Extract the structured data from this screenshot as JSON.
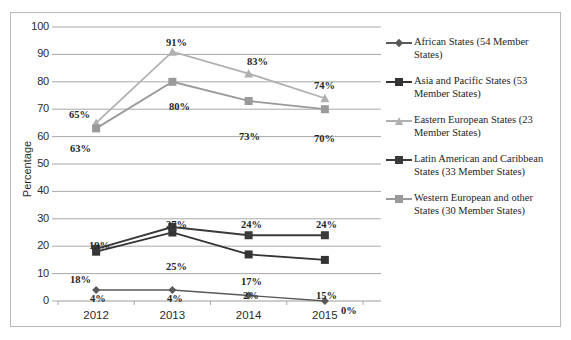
{
  "chart_data": {
    "type": "line",
    "title": "",
    "xlabel": "",
    "ylabel": "Percentage",
    "categories": [
      "2012",
      "2013",
      "2014",
      "2015"
    ],
    "ylim": [
      0,
      100
    ],
    "ytick_step": 10,
    "yticks": [
      "100",
      "90",
      "80",
      "70",
      "60",
      "50",
      "40",
      "30",
      "20",
      "10",
      "0"
    ],
    "grid": true,
    "legend_position": "right",
    "value_suffix": "%",
    "series": [
      {
        "name": "African States (54 Member States)",
        "short_name": "African States",
        "values": [
          4,
          4,
          2,
          0
        ],
        "labels": [
          "4%",
          "4%",
          "2%",
          "0%"
        ],
        "color": "#595959",
        "marker": "diamond"
      },
      {
        "name": "Asia and Pacific States (53 Member States)",
        "short_name": "Asia and Pacific States",
        "values": [
          18,
          25,
          17,
          15
        ],
        "labels": [
          "18%",
          "25%",
          "17%",
          "15%"
        ],
        "color": "#333333",
        "marker": "square"
      },
      {
        "name": "Eastern European States (23 Member States)",
        "short_name": "Eastern European States",
        "values": [
          65,
          91,
          83,
          74
        ],
        "labels": [
          "65%",
          "91%",
          "83%",
          "74%"
        ],
        "color": "#b0b0b0",
        "marker": "triangle"
      },
      {
        "name": "Latin American and Caribbean States (33 Member States)",
        "short_name": "Latin American and Caribbean States",
        "values": [
          19,
          27,
          24,
          24
        ],
        "labels": [
          "19%",
          "27%",
          "24%",
          "24%"
        ],
        "color": "#3a3a3a",
        "marker": "square"
      },
      {
        "name": "Western European and other States (30 Member States)",
        "short_name": "Western European and other States",
        "values": [
          63,
          80,
          73,
          70
        ],
        "labels": [
          "63%",
          "80%",
          "73%",
          "70%"
        ],
        "color": "#9a9a9a",
        "marker": "square"
      }
    ]
  },
  "axis": {
    "y_title": "Percentage",
    "y_ticks": [
      "100",
      "90",
      "80",
      "70",
      "60",
      "50",
      "40",
      "30",
      "20",
      "10",
      "0"
    ],
    "x_ticks": [
      "2012",
      "2013",
      "2014",
      "2015"
    ]
  },
  "legend": {
    "items": [
      {
        "label": "African States (54 Member States)",
        "color": "#595959",
        "marker": "diamond-marker"
      },
      {
        "label": "Asia and Pacific States (53 Member States)",
        "color": "#333333",
        "marker": "square-marker"
      },
      {
        "label": "Eastern European States (23 Member States)",
        "color": "#b0b0b0",
        "marker": "triangle-marker"
      },
      {
        "label": "Latin American and Caribbean States (33 Member States)",
        "color": "#3a3a3a",
        "marker": "square-marker"
      },
      {
        "label": "Western European and other States (30 Member States)",
        "color": "#9a9a9a",
        "marker": "square-marker"
      }
    ]
  },
  "data_labels": [
    {
      "text": "91%",
      "x": 155,
      "y": 24
    },
    {
      "text": "83%",
      "x": 236,
      "y": 43
    },
    {
      "text": "74%",
      "x": 303,
      "y": 67
    },
    {
      "text": "80%",
      "x": 158,
      "y": 88
    },
    {
      "text": "65%",
      "x": 58,
      "y": 96
    },
    {
      "text": "73%",
      "x": 228,
      "y": 118
    },
    {
      "text": "70%",
      "x": 303,
      "y": 120
    },
    {
      "text": "63%",
      "x": 59,
      "y": 130
    },
    {
      "text": "27%",
      "x": 155,
      "y": 206
    },
    {
      "text": "24%",
      "x": 230,
      "y": 206
    },
    {
      "text": "24%",
      "x": 305,
      "y": 206
    },
    {
      "text": "19%",
      "x": 78,
      "y": 227
    },
    {
      "text": "25%",
      "x": 155,
      "y": 248
    },
    {
      "text": "18%",
      "x": 59,
      "y": 261
    },
    {
      "text": "17%",
      "x": 230,
      "y": 263
    },
    {
      "text": "15%",
      "x": 305,
      "y": 277
    },
    {
      "text": "4%",
      "x": 79,
      "y": 280
    },
    {
      "text": "4%",
      "x": 156,
      "y": 280
    },
    {
      "text": "2%",
      "x": 232,
      "y": 277
    },
    {
      "text": "0%",
      "x": 330,
      "y": 292
    }
  ],
  "top_cut_text": ""
}
